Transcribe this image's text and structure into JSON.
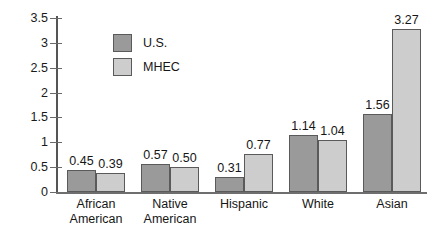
{
  "chart_data": {
    "type": "bar",
    "title": "",
    "subtitle": "",
    "xlabel": "",
    "ylabel": "",
    "ylim": [
      0,
      3.5
    ],
    "yticks": [
      "0",
      "0.5",
      "1",
      "1.5",
      "2",
      "2.5",
      "3",
      "3.5"
    ],
    "ytick_values": [
      0,
      0.5,
      1,
      1.5,
      2,
      2.5,
      3,
      3.5
    ],
    "grid": false,
    "legend_position": "upper-left-inside",
    "categories": [
      "African American",
      "Native American",
      "Hispanic",
      "White",
      "Asian"
    ],
    "category_lines": [
      [
        "African",
        "American"
      ],
      [
        "Native",
        "American"
      ],
      [
        "Hispanic"
      ],
      [
        "White"
      ],
      [
        "Asian"
      ]
    ],
    "series": [
      {
        "name": "U.S.",
        "color": "#9a9a9a",
        "values": [
          0.45,
          0.57,
          0.31,
          1.14,
          1.56
        ],
        "labels": [
          "0.45",
          "0.57",
          "0.31",
          "1.14",
          "1.56"
        ]
      },
      {
        "name": "MHEC",
        "color": "#cdcdcd",
        "values": [
          0.39,
          0.5,
          0.77,
          1.04,
          3.27
        ],
        "labels": [
          "0.39",
          "0.50",
          "0.77",
          "1.04",
          "3.27"
        ]
      }
    ]
  },
  "legend": {
    "items": [
      {
        "label": "U.S.",
        "color": "#9a9a9a"
      },
      {
        "label": "MHEC",
        "color": "#cdcdcd"
      }
    ]
  },
  "colors": {
    "series_us": "#9a9a9a",
    "series_mhec": "#cdcdcd",
    "bar_outline": "#5a5a5a",
    "axis": "#6a6a6a",
    "text": "#161616",
    "background": "#ffffff"
  }
}
